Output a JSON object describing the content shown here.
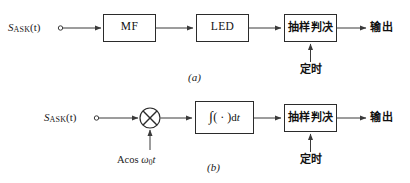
{
  "figure": {
    "caption_a": "(a)",
    "caption_b": "(b)"
  },
  "colors": {
    "line": "#3a3a3a",
    "box_border": "#2b2b2b",
    "text": "#111111",
    "background": "#ffffff"
  },
  "diagram_a": {
    "input_label_main": "S",
    "input_label_sub": "ASK",
    "input_label_arg": "(t)",
    "blocks": [
      {
        "name": "matched-filter",
        "label": "MF"
      },
      {
        "name": "led",
        "label": "LED"
      },
      {
        "name": "sampling-decision",
        "label": "抽样判决"
      }
    ],
    "timing_label": "定时",
    "output_label": "输出"
  },
  "diagram_b": {
    "input_label_main": "S",
    "input_label_sub": "ASK",
    "input_label_arg": "(t)",
    "multiplier_symbol": "×",
    "carrier": {
      "amplitude": "Acos",
      "omega": "ω",
      "omega_sub": "0",
      "variable": "t"
    },
    "integrator": {
      "integral_symbol": "∫",
      "operand": "( · )",
      "differential": "dt"
    },
    "blocks": [
      {
        "name": "sampling-decision",
        "label": "抽样判决"
      }
    ],
    "timing_label": "定时",
    "output_label": "输出"
  }
}
